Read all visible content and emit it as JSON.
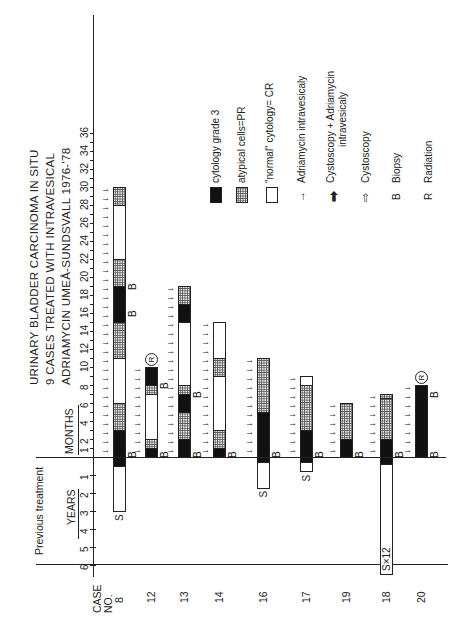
{
  "title": {
    "line1": "URINARY  BLADDER CARCINOMA IN  SITU",
    "line2": "9 CASES  TREATED WITH INTRAVESICAL",
    "line3": "ADRIAMYCIN  UMEÅ-SUNDSVALL 1976-'78"
  },
  "axes": {
    "months_label": "MONTHS",
    "years_label": "YEARS",
    "previous_label": "Previous treatment",
    "case_label": "CASE NO.",
    "case_label_1": "CASE",
    "case_label_2": "NO.",
    "month_ticks": [
      "1",
      "2",
      "4",
      "6",
      "8",
      "10",
      "12",
      "14",
      "16",
      "18",
      "20",
      "22",
      "24",
      "26",
      "28",
      "30",
      "32",
      "34",
      "36"
    ],
    "year_ticks": [
      "1",
      "2",
      "3",
      "4",
      "5",
      "6"
    ]
  },
  "legend": {
    "black": "cytology grade 3",
    "dotted": "atypical  cells=PR",
    "white": "\"normal\" cytology= CR",
    "thin_arrow": "Adriamycin  intravesicaly",
    "bold_arrow_1": "Cystoscopy + Adriamycin",
    "bold_arrow_2": "intravesicaly",
    "hollow_arrow": "Cystoscopy",
    "b_symbol": "B",
    "b_text": "Biopsy",
    "r_symbol": "R",
    "r_text": "Radiation"
  },
  "chart_data": {
    "type": "bar",
    "orientation": "horizontal stacked timeline (figure printed rotated 90°)",
    "xlabel": "MONTHS (after treatment start) / YEARS (previous treatment)",
    "ylabel": "CASE NO.",
    "xlim_months": [
      0,
      36
    ],
    "xlim_previous_years": [
      0,
      6
    ],
    "categories": [
      "8",
      "12",
      "13",
      "14",
      "16",
      "17",
      "19",
      "18",
      "20"
    ],
    "legend": [
      "cytology grade 3",
      "atypical cells=PR",
      "\"normal\" cytology= CR",
      "Adriamycin intravesicaly",
      "Cystoscopy + Adriamycin intravesicaly",
      "Cystoscopy",
      "Biopsy",
      "Radiation"
    ],
    "cases": [
      {
        "case": "8",
        "segments_months": [
          [
            "black",
            0,
            3
          ],
          [
            "dotted",
            3,
            6
          ],
          [
            "white",
            6,
            11
          ],
          [
            "dotted",
            11,
            15
          ],
          [
            "black",
            15,
            19
          ],
          [
            "dotted",
            19,
            22
          ],
          [
            "white",
            22,
            28
          ],
          [
            "dotted",
            28,
            30
          ]
        ],
        "previous_years": {
          "black": 0.5,
          "white_to": 3,
          "label": "S"
        },
        "biopsy_months": [
          0,
          16,
          19
        ],
        "radiation": false
      },
      {
        "case": "12",
        "segments_months": [
          [
            "black",
            0,
            1
          ],
          [
            "dotted",
            1,
            2
          ],
          [
            "white",
            2,
            7
          ],
          [
            "dotted",
            7,
            8
          ],
          [
            "black",
            8,
            10
          ]
        ],
        "previous_years": null,
        "biopsy_months": [
          0,
          8
        ],
        "radiation": true
      },
      {
        "case": "13",
        "segments_months": [
          [
            "black",
            0,
            2
          ],
          [
            "dotted",
            2,
            5
          ],
          [
            "black",
            5,
            7
          ],
          [
            "dotted",
            7,
            8
          ],
          [
            "white",
            8,
            15
          ],
          [
            "black",
            15,
            17
          ],
          [
            "dotted",
            17,
            19
          ]
        ],
        "previous_years": null,
        "biopsy_months": [
          0,
          7
        ],
        "radiation": false
      },
      {
        "case": "14",
        "segments_months": [
          [
            "black",
            0,
            1
          ],
          [
            "dotted",
            1,
            3
          ],
          [
            "white",
            3,
            9
          ],
          [
            "dotted",
            9,
            11
          ],
          [
            "white",
            11,
            15
          ]
        ],
        "previous_years": null,
        "biopsy_months": [
          0
        ],
        "radiation": false
      },
      {
        "case": "16",
        "segments_months": [
          [
            "black",
            0,
            5
          ],
          [
            "dotted",
            5,
            11
          ]
        ],
        "previous_years": {
          "black": 0.3,
          "white_to": 1.7,
          "label": "S"
        },
        "biopsy_months": [
          0
        ],
        "radiation": false
      },
      {
        "case": "17",
        "segments_months": [
          [
            "black",
            0,
            3
          ],
          [
            "dotted",
            3,
            8
          ],
          [
            "white",
            8,
            9
          ]
        ],
        "previous_years": {
          "black": 0.3,
          "white_to": 0.8,
          "label": "S"
        },
        "biopsy_months": [
          0
        ],
        "radiation": false
      },
      {
        "case": "19",
        "segments_months": [
          [
            "black",
            0,
            2
          ],
          [
            "dotted",
            2,
            6
          ]
        ],
        "previous_years": null,
        "biopsy_months": [
          0
        ],
        "radiation": false
      },
      {
        "case": "18",
        "segments_months": [
          [
            "black",
            0,
            2
          ],
          [
            "dotted",
            2,
            6.5
          ],
          [
            "dotted",
            6.5,
            7
          ]
        ],
        "previous_years": {
          "black": 0.4,
          "white_to": 6.5,
          "label": "S×12"
        },
        "biopsy_months": [
          0
        ],
        "radiation": false
      },
      {
        "case": "20",
        "segments_months": [
          [
            "black",
            0,
            8
          ]
        ],
        "previous_years": null,
        "biopsy_months": [
          0,
          7
        ],
        "radiation": true
      }
    ]
  },
  "cases_display": [
    "8",
    "12",
    "13",
    "14",
    "16",
    "17",
    "19",
    "18",
    "20"
  ],
  "row_labels": {
    "s8": "S",
    "s16": "S",
    "s17": "S",
    "s18": "S×12",
    "B": "B",
    "R": "R"
  }
}
